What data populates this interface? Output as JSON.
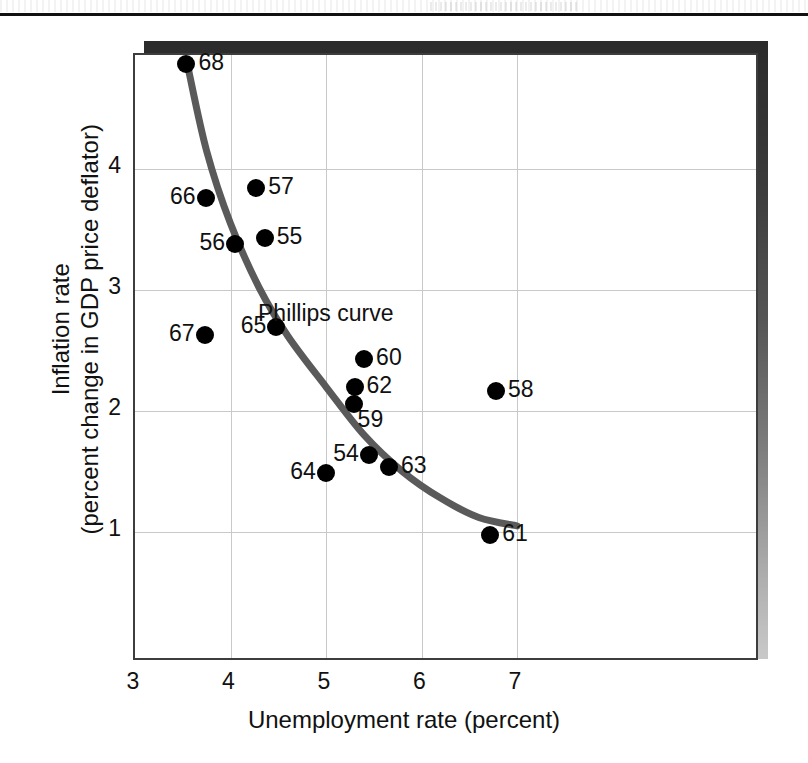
{
  "figure": {
    "x_axis_title": "Unemployment rate (percent)",
    "y_axis_title_line1": "Inflation rate",
    "y_axis_title_line2": "(percent change in GDP price deflator)",
    "curve_annotation": "Phillips curve",
    "curve_color": "#5a5a5a",
    "point_color": "#000000",
    "grid_color": "#c9c9c9",
    "frame_color": "#3d3d3d"
  },
  "chart_data": {
    "type": "scatter",
    "title": "",
    "xlabel": "Unemployment rate (percent)",
    "ylabel": "Inflation rate (percent change in GDP price deflator)",
    "xlim": [
      3,
      7.6
    ],
    "ylim": [
      0.35,
      5.35
    ],
    "xticks": [
      "3",
      "4",
      "5",
      "6",
      "7"
    ],
    "yticks": [
      "1",
      "2",
      "3",
      "4"
    ],
    "grid": true,
    "legend": "none",
    "annotations": [
      {
        "text": "Phillips curve",
        "x": 5.0,
        "y": 2.78
      }
    ],
    "series": [
      {
        "name": "U.S. inflation and unemployment, 1954-1968",
        "point_label_key": "year",
        "points": [
          {
            "year": "68",
            "x": 3.56,
            "y": 4.85,
            "label_side": "right"
          },
          {
            "year": "66",
            "x": 3.76,
            "y": 3.74,
            "label_side": "left"
          },
          {
            "year": "57",
            "x": 4.29,
            "y": 3.83,
            "label_side": "right"
          },
          {
            "year": "56",
            "x": 4.07,
            "y": 3.36,
            "label_side": "left"
          },
          {
            "year": "55",
            "x": 4.38,
            "y": 3.41,
            "label_side": "right"
          },
          {
            "year": "67",
            "x": 3.75,
            "y": 2.61,
            "label_side": "left"
          },
          {
            "year": "65",
            "x": 4.5,
            "y": 2.68,
            "label_side": "left"
          },
          {
            "year": "60",
            "x": 5.42,
            "y": 2.41,
            "label_side": "right"
          },
          {
            "year": "62",
            "x": 5.32,
            "y": 2.18,
            "label_side": "right"
          },
          {
            "year": "59",
            "x": 5.31,
            "y": 2.04,
            "label_side": "below-right"
          },
          {
            "year": "58",
            "x": 6.8,
            "y": 2.15,
            "label_side": "right"
          },
          {
            "year": "54",
            "x": 5.47,
            "y": 1.62,
            "label_side": "left"
          },
          {
            "year": "63",
            "x": 5.68,
            "y": 1.52,
            "label_side": "right"
          },
          {
            "year": "64",
            "x": 5.02,
            "y": 1.47,
            "label_side": "left"
          },
          {
            "year": "61",
            "x": 6.74,
            "y": 0.96,
            "label_side": "right"
          }
        ]
      }
    ],
    "curve": {
      "name": "Phillips curve",
      "points": [
        {
          "x": 3.56,
          "y": 4.82
        },
        {
          "x": 3.75,
          "y": 4.15
        },
        {
          "x": 4.0,
          "y": 3.55
        },
        {
          "x": 4.3,
          "y": 3.02
        },
        {
          "x": 4.6,
          "y": 2.62
        },
        {
          "x": 5.0,
          "y": 2.2
        },
        {
          "x": 5.4,
          "y": 1.8
        },
        {
          "x": 5.8,
          "y": 1.5
        },
        {
          "x": 6.2,
          "y": 1.28
        },
        {
          "x": 6.6,
          "y": 1.12
        },
        {
          "x": 7.0,
          "y": 1.05
        }
      ]
    }
  }
}
